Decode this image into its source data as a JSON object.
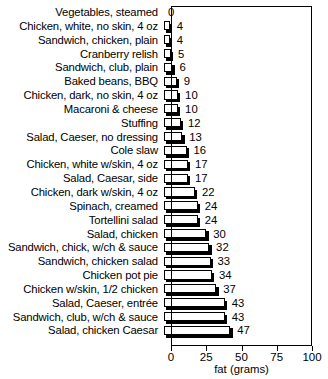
{
  "chart_data": {
    "type": "bar",
    "orientation": "horizontal",
    "title": "",
    "xlabel": "fat (grams)",
    "ylabel": "",
    "xlim": [
      0,
      100
    ],
    "xticks": [
      0,
      25,
      50,
      75,
      100
    ],
    "grid": false,
    "legend": null,
    "categories": [
      "Vegetables, steamed",
      "Chicken, white, no skin, 4 oz",
      "Sandwich, chicken, plain",
      "Cranberry relish",
      "Sandwich, club, plain",
      "Baked beans, BBQ",
      "Chicken, dark, no skin, 4 oz",
      "Macaroni & cheese",
      "Stuffing",
      "Salad, Caeser, no dressing",
      "Cole slaw",
      "Chicken, white w/skin, 4 oz",
      "Salad, Caesar, side",
      "Chicken, dark w/skin, 4 oz",
      "Spinach, creamed",
      "Tortellini salad",
      "Salad, chicken",
      "Sandwich, chick, w/ch & sauce",
      "Sandwich, chicken salad",
      "Chicken pot pie",
      "Chicken w/skin, 1/2 chicken",
      "Salad, Caeser, entrée",
      "Sandwich, club, w/ch & sauce",
      "Salad, chicken Caesar"
    ],
    "values": [
      0,
      4,
      4,
      5,
      6,
      9,
      10,
      10,
      12,
      13,
      16,
      17,
      17,
      22,
      24,
      24,
      30,
      32,
      33,
      34,
      37,
      43,
      43,
      47
    ],
    "value_labels": [
      "0",
      "4",
      "4",
      "5",
      "6",
      "9",
      "10",
      "10",
      "12",
      "13",
      "16",
      "17",
      "17",
      "22",
      "24",
      "24",
      "30",
      "32",
      "33",
      "34",
      "37",
      "43",
      "43",
      "47"
    ],
    "colors": {
      "bar_face": "#ffffff",
      "bar_outline": "#000000",
      "bar_shadow": "#000000",
      "axis": "#000000",
      "text": "#000000",
      "background": "#ffffff"
    }
  }
}
